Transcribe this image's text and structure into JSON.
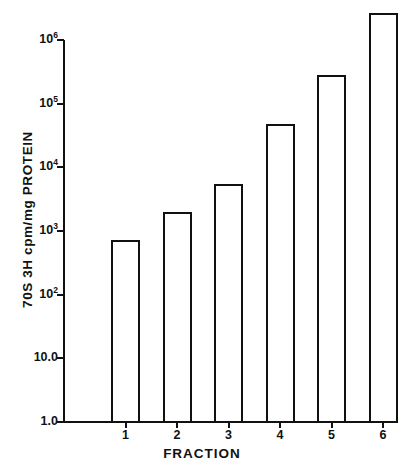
{
  "chart_data": {
    "type": "bar",
    "title": "",
    "xlabel": "FRACTION",
    "ylabel": "70S 3H cpm/mg PROTEIN",
    "categories": [
      "1",
      "2",
      "3",
      "4",
      "5",
      "6"
    ],
    "values": [
      700,
      1900,
      5200,
      47000,
      270000,
      2600000
    ],
    "yscale": "log",
    "ylim": [
      1,
      1000000
    ],
    "ytick_values": [
      1,
      10,
      100,
      1000,
      10000,
      100000,
      1000000
    ],
    "ytick_labels": [
      "1.0",
      "10.0",
      "10²",
      "10³",
      "10⁴",
      "10⁵",
      "10⁶"
    ],
    "grid": false,
    "legend": null,
    "bar_fill": "#ffffff",
    "bar_edge": "#111111",
    "axis_color": "#111111"
  },
  "axis": {
    "y_ticks": [
      {
        "label_base": "1.0",
        "sup": "",
        "value": 1
      },
      {
        "label_base": "10.0",
        "sup": "",
        "value": 10
      },
      {
        "label_base": "10",
        "sup": "2",
        "value": 100
      },
      {
        "label_base": "10",
        "sup": "3",
        "value": 1000
      },
      {
        "label_base": "10",
        "sup": "4",
        "value": 10000
      },
      {
        "label_base": "10",
        "sup": "5",
        "value": 100000
      },
      {
        "label_base": "10",
        "sup": "6",
        "value": 1000000
      }
    ],
    "x_ticks": [
      "1",
      "2",
      "3",
      "4",
      "5",
      "6"
    ],
    "y_title": "70S 3H cpm/mg PROTEIN",
    "x_title": "FRACTION"
  },
  "caption": {
    "text": ""
  }
}
